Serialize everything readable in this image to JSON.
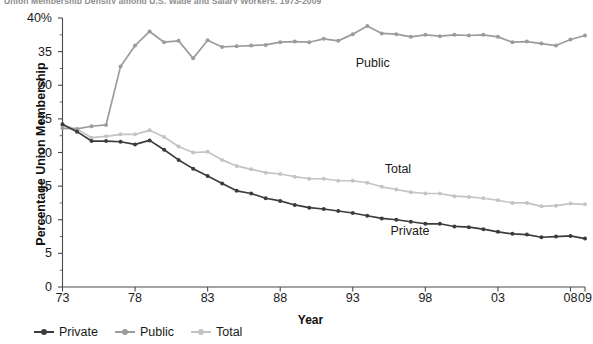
{
  "title": "Union Membership Density among U.S. Wage and Salary Workers, 1973-2009",
  "axes": {
    "ylabel": "Percentage Union Membership",
    "xlabel": "Year",
    "yticks": [
      "0",
      "5",
      "10",
      "15",
      "20",
      "25",
      "30",
      "35",
      "40%"
    ],
    "ytick_values": [
      0,
      5,
      10,
      15,
      20,
      25,
      30,
      35,
      40
    ],
    "xticks": [
      "73",
      "78",
      "83",
      "88",
      "93",
      "98",
      "03",
      "08",
      "09"
    ],
    "xtick_values": [
      1973,
      1978,
      1983,
      1988,
      1993,
      1998,
      2003,
      2008,
      2009
    ],
    "ylim": [
      0,
      40
    ],
    "xlim": [
      1973,
      2009
    ],
    "grid": false
  },
  "legend": {
    "position": "bottom-left",
    "items": [
      {
        "label": "Private",
        "color": "#3c3c3c"
      },
      {
        "label": "Public",
        "color": "#9c9c9c"
      },
      {
        "label": "Total",
        "color": "#c4c4c4"
      }
    ]
  },
  "annotations": [
    {
      "text": "Public",
      "x": 1993.2,
      "y": 33.2
    },
    {
      "text": "Total",
      "x": 1995.2,
      "y": 17.4
    },
    {
      "text": "Private",
      "x": 1995.6,
      "y": 8.2
    }
  ],
  "chart_data": {
    "type": "line",
    "title": "Union Membership Density among U.S. Wage and Salary Workers, 1973-2009",
    "xlabel": "Year",
    "ylabel": "Percentage Union Membership",
    "ylim": [
      0,
      40
    ],
    "xlim": [
      1973,
      2009
    ],
    "grid": false,
    "x": [
      1973,
      1974,
      1975,
      1976,
      1977,
      1978,
      1979,
      1980,
      1981,
      1982,
      1983,
      1984,
      1985,
      1986,
      1987,
      1988,
      1989,
      1990,
      1991,
      1992,
      1993,
      1994,
      1995,
      1996,
      1997,
      1998,
      1999,
      2000,
      2001,
      2002,
      2003,
      2004,
      2005,
      2006,
      2007,
      2008,
      2009
    ],
    "series": [
      {
        "name": "Private",
        "color": "#3c3c3c",
        "values": [
          24.2,
          23.1,
          21.7,
          21.7,
          21.6,
          21.2,
          21.8,
          20.4,
          18.9,
          17.6,
          16.5,
          15.4,
          14.3,
          13.9,
          13.2,
          12.8,
          12.2,
          11.8,
          11.6,
          11.3,
          11.0,
          10.6,
          10.2,
          10.0,
          9.7,
          9.4,
          9.4,
          9.0,
          8.9,
          8.6,
          8.2,
          7.9,
          7.8,
          7.4,
          7.5,
          7.6,
          7.2
        ]
      },
      {
        "name": "Public",
        "color": "#9c9c9c",
        "values": [
          23.6,
          23.5,
          23.9,
          24.1,
          32.8,
          35.9,
          38.0,
          36.4,
          36.6,
          34.0,
          36.7,
          35.7,
          35.8,
          35.9,
          36.0,
          36.4,
          36.5,
          36.4,
          36.9,
          36.6,
          37.6,
          38.8,
          37.7,
          37.6,
          37.2,
          37.5,
          37.3,
          37.5,
          37.4,
          37.5,
          37.2,
          36.4,
          36.5,
          36.2,
          35.9,
          36.8,
          37.4
        ]
      },
      {
        "name": "Total",
        "color": "#c4c4c4",
        "values": [
          24.0,
          23.5,
          22.2,
          22.4,
          22.7,
          22.7,
          23.3,
          22.3,
          20.9,
          20.0,
          20.1,
          18.9,
          18.0,
          17.5,
          17.0,
          16.8,
          16.4,
          16.1,
          16.1,
          15.8,
          15.8,
          15.5,
          14.9,
          14.5,
          14.1,
          13.9,
          13.9,
          13.5,
          13.4,
          13.2,
          12.9,
          12.5,
          12.5,
          12.0,
          12.1,
          12.4,
          12.3
        ]
      }
    ]
  }
}
